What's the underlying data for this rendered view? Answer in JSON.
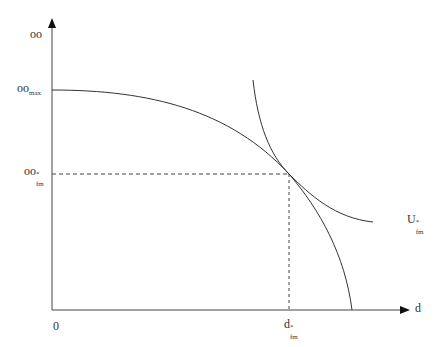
{
  "diagram": {
    "type": "production-possibility-frontier-with-indifference-curve",
    "axes": {
      "y_label": "oo",
      "x_label": "d",
      "origin_label": "0"
    },
    "labels": {
      "oo_max_base": "oo",
      "oo_max_sub": "max",
      "oo_fm_base": "oo",
      "oo_fm_sup": "*",
      "oo_fm_sub": "fm",
      "d_fm_base": "d",
      "d_fm_sup": "*",
      "d_fm_sub": "fm",
      "u_fm_base": "U",
      "u_fm_sup": "*",
      "u_fm_sub": "fm"
    },
    "curves": [
      {
        "name": "production possibility frontier",
        "from": "oo_max on y-axis",
        "to": "x-axis near d=max"
      },
      {
        "name": "indifference curve U*fm",
        "tangent_at": "(d*fm, oo*fm)"
      }
    ],
    "colors": {
      "line": "#333333",
      "background": "#ffffff"
    }
  }
}
